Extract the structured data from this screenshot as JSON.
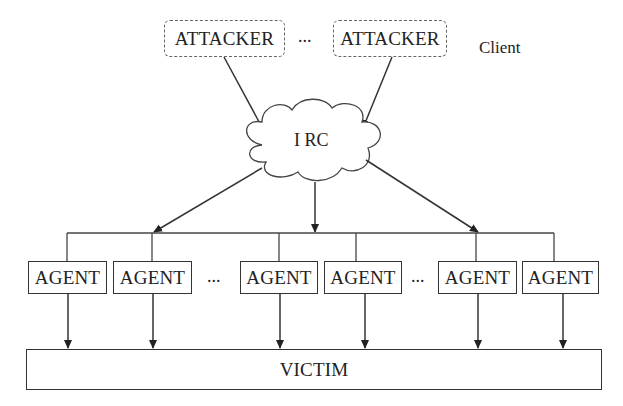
{
  "diagram": {
    "client_label": "Client",
    "cloud_label": "I RC",
    "attackers": [
      {
        "label": "ATTACKER"
      },
      {
        "label": "ATTACKER"
      }
    ],
    "attacker_ellipsis": "...",
    "agents": [
      {
        "label": "AGENT"
      },
      {
        "label": "AGENT"
      },
      {
        "label": "AGENT"
      },
      {
        "label": "AGENT"
      },
      {
        "label": "AGENT"
      },
      {
        "label": "AGENT"
      }
    ],
    "agent_ellipses": [
      "...",
      "..."
    ],
    "victim_label": "VICTIM"
  }
}
